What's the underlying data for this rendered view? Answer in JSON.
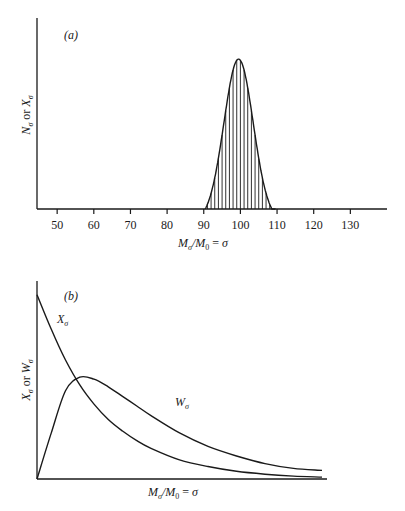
{
  "chart_data": [
    {
      "type": "bar",
      "panel": "(a)",
      "title": "",
      "xlabel": "M_σ/M_0 = σ",
      "ylabel": "N_σ or X_σ",
      "xlim": [
        44.5,
        140
      ],
      "x_ticks": [
        50,
        60,
        70,
        80,
        90,
        100,
        110,
        120,
        130
      ],
      "grid": false,
      "description": "Narrow Poisson-like distribution centered near σ = 100, drawn as a smooth envelope with vertical hatching at integer σ",
      "categories": [
        91,
        92,
        93,
        94,
        95,
        96,
        97,
        98,
        99,
        100,
        101,
        102,
        103,
        104,
        105,
        106,
        107,
        108,
        109
      ],
      "values": [
        0.02,
        0.06,
        0.14,
        0.26,
        0.41,
        0.58,
        0.74,
        0.88,
        0.98,
        1.0,
        0.96,
        0.86,
        0.72,
        0.55,
        0.38,
        0.23,
        0.12,
        0.05,
        0.01
      ],
      "peak_x": 99.5
    },
    {
      "type": "line",
      "panel": "(b)",
      "title": "",
      "xlabel": "M_σ/M_0 = σ",
      "ylabel": "X_σ or W_σ",
      "grid": false,
      "x": [
        0,
        0.05,
        0.1,
        0.15,
        0.2,
        0.25,
        0.3,
        0.35,
        0.4,
        0.5,
        0.6,
        0.7,
        0.8,
        0.9,
        1.0
      ],
      "series": [
        {
          "name": "X_σ",
          "values": [
            0.96,
            0.78,
            0.62,
            0.49,
            0.39,
            0.31,
            0.25,
            0.2,
            0.16,
            0.1,
            0.065,
            0.04,
            0.025,
            0.015,
            0.01
          ]
        },
        {
          "name": "W_σ",
          "values": [
            0.0,
            0.24,
            0.46,
            0.53,
            0.52,
            0.48,
            0.43,
            0.38,
            0.33,
            0.24,
            0.17,
            0.12,
            0.08,
            0.055,
            0.045
          ]
        }
      ],
      "annotations": [
        "X_σ",
        "W_σ"
      ]
    }
  ],
  "labels": {
    "panel_a": "(a)",
    "panel_b": "(b)",
    "a_ylabel": "N_σ or X_σ",
    "a_xlabel": "M_σ/M_0 = σ",
    "b_ylabel": "X_σ or W_σ",
    "b_xlabel": "M_σ/M_0 = σ",
    "curve_x": "X_σ",
    "curve_w": "W_σ"
  }
}
